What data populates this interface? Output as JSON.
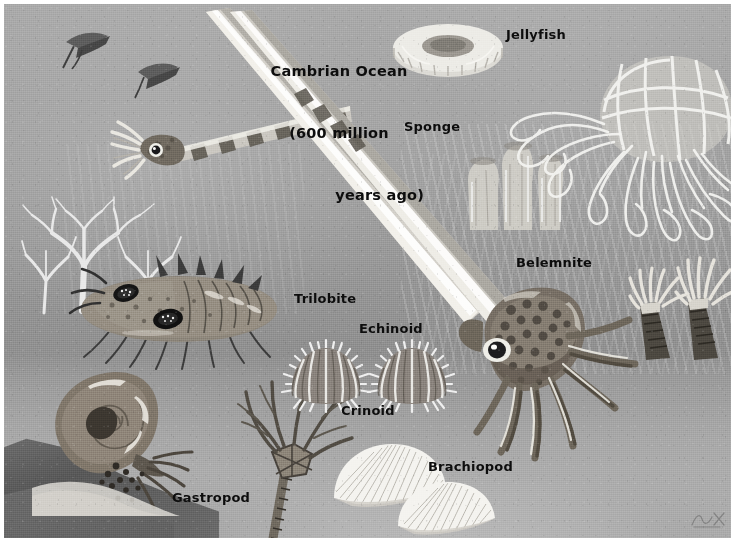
{
  "illustration": {
    "title_lines": "Cambrian Ocean\n(600 million\nyears ago)",
    "title_line1": "Cambrian Ocean",
    "title_line2": "(600 million",
    "title_line3": "years ago)",
    "era": "Cambrian",
    "age_text": "600 million years ago",
    "palette": {
      "water_top": "#a8a8a8",
      "water_mid": "#909090",
      "seabed": "#adadad",
      "rock_dark": "#4f4f4f",
      "label_text": "#0d0d0d",
      "highlight_white": "#f2f2f2",
      "border": "#ffffff"
    },
    "labels": [
      {
        "id": "jellyfish",
        "text": "Jellyfish"
      },
      {
        "id": "sponge",
        "text": "Sponge"
      },
      {
        "id": "belemnite",
        "text": "Belemnite"
      },
      {
        "id": "trilobite",
        "text": "Trilobite"
      },
      {
        "id": "echinoid",
        "text": "Echinoid"
      },
      {
        "id": "crinoid",
        "text": "Crinoid"
      },
      {
        "id": "brachiopod",
        "text": "Brachiopod"
      },
      {
        "id": "gastropod",
        "text": "Gastropod"
      }
    ],
    "organisms": [
      {
        "name": "Jellyfish",
        "description": "Translucent white bell with long trailing tentacles"
      },
      {
        "name": "Sponge",
        "description": "Cluster of pale tube sponges"
      },
      {
        "name": "Belemnite",
        "description": "Large spotted squid-like cephalopod with long straight shell"
      },
      {
        "name": "Trilobite",
        "description": "Segmented arthropod with large compound eyes and spines"
      },
      {
        "name": "Echinoid",
        "description": "Two spiny sea urchins"
      },
      {
        "name": "Crinoid",
        "description": "Stalked sea lily with feathery arms"
      },
      {
        "name": "Brachiopod",
        "description": "Two white fan-shaped ribbed shells"
      },
      {
        "name": "Gastropod",
        "description": "Coiled shell snail with tentacles on rock"
      },
      {
        "name": "Nautiloid",
        "description": "Banded orthocone cephalopod swimming upper left"
      },
      {
        "name": "Horn coral",
        "description": "Pair of conical corals with tentacle crowns"
      },
      {
        "name": "Bryozoan",
        "description": "Branching white tree-like colonies"
      }
    ]
  }
}
